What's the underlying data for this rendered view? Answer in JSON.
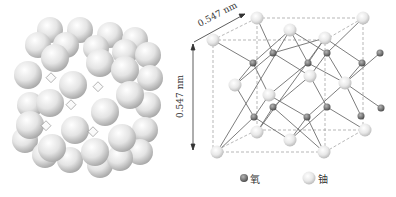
{
  "figure": {
    "left_panel": {
      "description": "close-packed sphere model of UO2 crystal"
    },
    "right_panel": {
      "dimension_top": "0.547 nm",
      "dimension_left": "0.547 nm"
    },
    "legend": [
      {
        "label": "氧",
        "symbol": "small-dark-sphere"
      },
      {
        "label": "铀",
        "symbol": "large-light-sphere"
      }
    ],
    "colors": {
      "uranium": "#e6e6e6",
      "oxygen": "#7a7a7a",
      "bond": "#6e6e6e",
      "cube": "#999999"
    }
  }
}
